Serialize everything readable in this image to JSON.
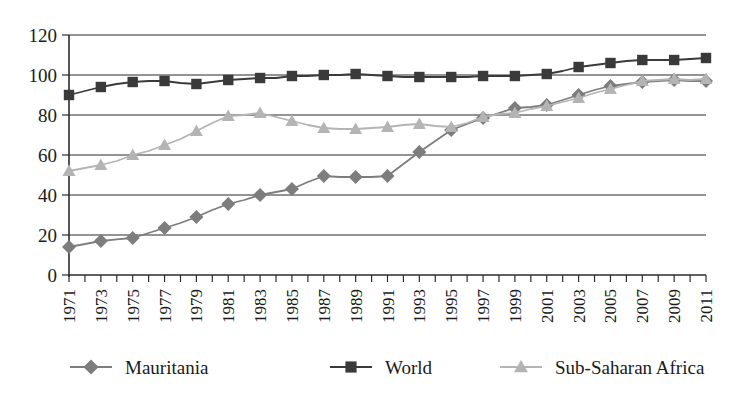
{
  "chart_data": {
    "type": "line",
    "title": "",
    "subtitle": "",
    "xlabel": "",
    "ylabel": "",
    "ylim": [
      0,
      120
    ],
    "ytick_step": 20,
    "yticks": [
      0,
      20,
      40,
      60,
      80,
      100,
      120
    ],
    "grid": true,
    "legend_position": "bottom",
    "categories": [
      "1971",
      "1972",
      "1973",
      "1974",
      "1975",
      "1976",
      "1977",
      "1978",
      "1979",
      "1980",
      "1981",
      "1982",
      "1983",
      "1984",
      "1985",
      "1986",
      "1987",
      "1988",
      "1989",
      "1990",
      "1991",
      "1992",
      "1993",
      "1994",
      "1995",
      "1996",
      "1997",
      "1998",
      "1999",
      "2000",
      "2001",
      "2002",
      "2003",
      "2004",
      "2005",
      "2006",
      "2007",
      "2008",
      "2009",
      "2010",
      "2011"
    ],
    "xtick_labels": [
      "1971",
      "1973",
      "1975",
      "1977",
      "1979",
      "1981",
      "1983",
      "1985",
      "1987",
      "1989",
      "1991",
      "1993",
      "1995",
      "1997",
      "1999",
      "2001",
      "2003",
      "2005",
      "2007",
      "2009",
      "2011"
    ],
    "series": [
      {
        "name": "Mauritania",
        "marker": "diamond",
        "color": "#7d7d7d",
        "values": [
          14.0,
          15.5,
          17.0,
          17.8,
          18.5,
          21.0,
          23.5,
          26.0,
          29.0,
          32.5,
          35.5,
          37.5,
          40.0,
          41.5,
          43.0,
          46.5,
          49.5,
          49.0,
          49.0,
          49.0,
          49.5,
          55.5,
          61.5,
          67.0,
          72.5,
          75.5,
          78.5,
          81.0,
          83.5,
          84.0,
          85.0,
          87.5,
          90.0,
          92.5,
          94.5,
          95.5,
          96.5,
          97.0,
          97.5,
          97.0,
          97.0
        ]
      },
      {
        "name": "World",
        "marker": "square",
        "color": "#3a3a3a",
        "values": [
          90.0,
          92.0,
          94.0,
          95.5,
          96.5,
          97.0,
          97.0,
          96.0,
          95.5,
          96.5,
          97.5,
          98.0,
          98.5,
          98.5,
          99.5,
          99.5,
          100.0,
          100.0,
          100.5,
          100.0,
          99.5,
          99.0,
          99.0,
          99.0,
          99.0,
          99.0,
          99.5,
          99.5,
          99.5,
          100.0,
          100.5,
          102.0,
          104.0,
          105.0,
          106.0,
          107.0,
          107.5,
          107.5,
          107.5,
          108.0,
          108.5
        ]
      },
      {
        "name": "Sub-Saharan Africa",
        "marker": "triangle",
        "color": "#b4b4b4",
        "values": [
          52.0,
          53.5,
          55.0,
          57.0,
          60.0,
          62.0,
          65.0,
          68.0,
          72.0,
          76.0,
          79.5,
          80.0,
          81.0,
          79.0,
          77.0,
          75.0,
          73.5,
          73.0,
          73.0,
          73.5,
          74.0,
          75.0,
          75.5,
          74.5,
          74.0,
          76.0,
          79.0,
          80.5,
          81.0,
          83.0,
          84.5,
          86.5,
          88.5,
          91.0,
          93.0,
          95.0,
          97.0,
          97.5,
          98.0,
          97.5,
          98.0
        ]
      }
    ]
  },
  "legend": {
    "items": [
      {
        "label": "Mauritania",
        "marker": "diamond-marker-icon",
        "color": "#7d7d7d"
      },
      {
        "label": "World",
        "marker": "square-marker-icon",
        "color": "#3a3a3a"
      },
      {
        "label": "Sub-Saharan Africa",
        "marker": "triangle-marker-icon",
        "color": "#b4b4b4"
      }
    ]
  }
}
